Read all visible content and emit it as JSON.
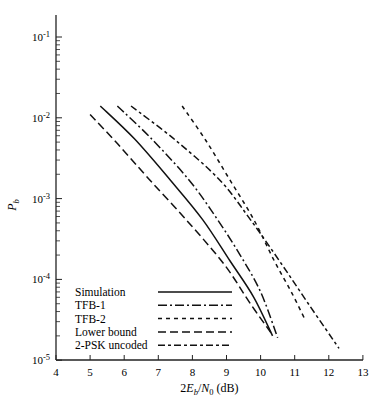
{
  "chart_data": {
    "type": "line",
    "title": "",
    "xlabel": "2E_b/N_0 (dB)",
    "ylabel": "P_b",
    "xscale": "linear",
    "yscale": "log",
    "xlim": [
      4,
      13
    ],
    "ylim": [
      1e-05,
      0.2
    ],
    "x_ticks": [
      "4",
      "5",
      "6",
      "7",
      "8",
      "9",
      "10",
      "11",
      "12",
      "13"
    ],
    "y_ticks": [
      {
        "base": "10",
        "exp": "-1"
      },
      {
        "base": "10",
        "exp": "-2"
      },
      {
        "base": "10",
        "exp": "-3"
      },
      {
        "base": "10",
        "exp": "-4"
      },
      {
        "base": "10",
        "exp": "-5"
      }
    ],
    "grid": false,
    "legend_position": "lower left (inside)",
    "series": [
      {
        "name": "Simulation",
        "style": "solid",
        "x": [
          5.3,
          6.3,
          7.35,
          8.3,
          9.1,
          9.8,
          10.35
        ],
        "y": [
          0.014,
          0.0055,
          0.0017,
          0.00055,
          0.00017,
          6e-05,
          2e-05
        ]
      },
      {
        "name": "TFB-1",
        "style": "dash-dot",
        "x": [
          5.8,
          6.8,
          7.9,
          8.7,
          9.4,
          10.0,
          10.5
        ],
        "y": [
          0.014,
          0.0055,
          0.0017,
          0.00058,
          0.0002,
          7e-05,
          1.9e-05
        ]
      },
      {
        "name": "TFB-2",
        "style": "short-dash",
        "x": [
          7.7,
          8.4,
          9.1,
          9.8,
          10.4,
          10.9,
          11.3
        ],
        "y": [
          0.014,
          0.0052,
          0.0017,
          0.00055,
          0.00017,
          7e-05,
          3.2e-05
        ]
      },
      {
        "name": "Lower bound",
        "style": "long-dash",
        "x": [
          5.0,
          5.8,
          6.75,
          7.9,
          8.95,
          9.7,
          10.3
        ],
        "y": [
          0.011,
          0.0048,
          0.0017,
          0.0005,
          0.00015,
          5e-05,
          2.2e-05
        ]
      },
      {
        "name": "2-PSK uncoded",
        "style": "dash",
        "x": [
          6.2,
          7.5,
          8.8,
          9.7,
          10.55,
          11.4,
          12.3
        ],
        "y": [
          0.014,
          0.0053,
          0.0017,
          0.00055,
          0.00017,
          5e-05,
          1.4e-05
        ]
      }
    ]
  },
  "axes": {
    "xlabel_parts": {
      "pre": "2",
      "E": "E",
      "b": "b",
      "slash": "/",
      "N": "N",
      "zero": "0",
      "unit": " (dB)"
    },
    "ylabel_parts": {
      "P": "P",
      "b": "b"
    }
  }
}
